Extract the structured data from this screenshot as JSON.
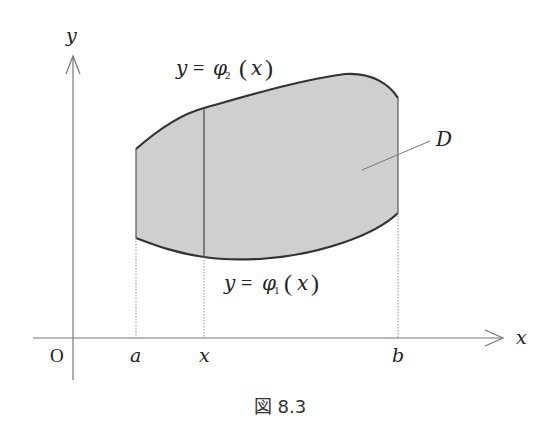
{
  "figure": {
    "caption": "図 8.3",
    "axes": {
      "x_label": "x",
      "y_label": "y",
      "origin_label": "O"
    },
    "ticks": {
      "a": "a",
      "x": "x",
      "b": "b"
    },
    "region_label": "D",
    "upper_curve": {
      "lhs": "y",
      "eq": "=",
      "func": "φ",
      "sub": "2",
      "lparen": "(",
      "arg": "x",
      "rparen": ")"
    },
    "lower_curve": {
      "lhs": "y",
      "eq": "=",
      "func": "φ",
      "sub": "1",
      "lparen": "(",
      "arg": "x",
      "rparen": ")"
    },
    "colors": {
      "region_fill": "#cfcfcf",
      "curve_stroke": "#333333",
      "axis_stroke": "#777777",
      "guide_stroke": "#999999"
    }
  }
}
